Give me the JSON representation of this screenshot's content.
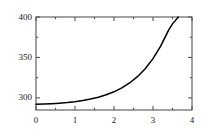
{
  "chart_data": {
    "type": "line",
    "title": "",
    "xlabel": "",
    "ylabel": "",
    "xlim": [
      0,
      4
    ],
    "ylim": [
      285,
      400
    ],
    "grid": false,
    "legend": null,
    "frame": "box",
    "line_color": "#000000",
    "axis_color": "#555555",
    "x_ticks_major": [
      "0",
      "1",
      "2",
      "3",
      "4"
    ],
    "x_ticks_major_values": [
      0,
      1,
      2,
      3,
      4
    ],
    "x_ticks_minor_values": [
      0.5,
      1.5,
      2.5,
      3.5
    ],
    "y_ticks_major": [
      "300",
      "350",
      "400"
    ],
    "y_ticks_major_values": [
      300,
      350,
      400
    ],
    "y_ticks_minor_values": [
      325,
      375
    ],
    "series": [
      {
        "name": "curve",
        "x": [
          0.0,
          0.2,
          0.4,
          0.6,
          0.8,
          1.0,
          1.2,
          1.4,
          1.6,
          1.8,
          2.0,
          2.2,
          2.4,
          2.6,
          2.8,
          3.0,
          3.2,
          3.4,
          3.5,
          3.65
        ],
        "y": [
          292,
          292.3,
          292.8,
          293.4,
          294.2,
          295.3,
          296.7,
          298.5,
          300.8,
          303.8,
          307.5,
          312.3,
          318.4,
          326.2,
          336.0,
          348.5,
          364.2,
          383.8,
          391.5,
          400
        ]
      }
    ]
  }
}
